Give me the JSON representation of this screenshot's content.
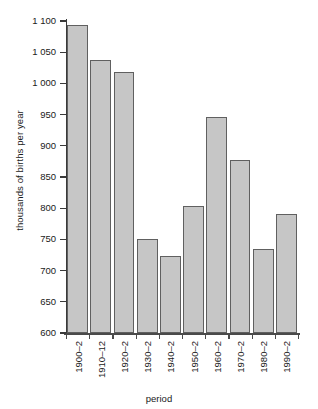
{
  "chart_data": {
    "type": "bar",
    "title": "",
    "xlabel": "period",
    "ylabel": "thousands of births per year",
    "categories": [
      "1900–2",
      "1910–12",
      "1920–2",
      "1930–2",
      "1940–2",
      "1950–2",
      "1960–2",
      "1970–2",
      "1980–2",
      "1990–2"
    ],
    "values": [
      1094,
      1037,
      1018,
      751,
      723,
      804,
      946,
      878,
      735,
      790
    ],
    "ylim": [
      600,
      1100
    ],
    "ytick_values": [
      600,
      650,
      700,
      750,
      800,
      850,
      900,
      950,
      1000,
      1050,
      1100
    ],
    "ytick_labels": [
      "600",
      "650",
      "700",
      "750",
      "800",
      "850",
      "900",
      "950",
      "1 000",
      "1 050",
      "1 100"
    ],
    "grid": false,
    "legend": null,
    "bar_fill_color": "#c6c6c6",
    "bar_edge_color": "#606060",
    "axis_color": "#3a3a3a",
    "background_color": "#ffffff"
  }
}
